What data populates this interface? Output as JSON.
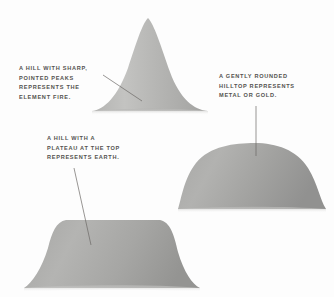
{
  "figure": {
    "background_color": "#fdfdfd",
    "text_color": "#54524f",
    "leader_line_color": "#6b6965",
    "hill_fill_light": "#bfbfbd",
    "hill_fill_mid": "#a8a8a6",
    "hill_fill_dark": "#949492"
  },
  "annotations": [
    {
      "id": "fire",
      "name": "fire-hill-caption",
      "lines": [
        "A HILL WITH SHARP,",
        "POINTED PEAKS",
        "REPRESENTS THE",
        "ELEMENT FIRE."
      ]
    },
    {
      "id": "metal",
      "name": "metal-hill-caption",
      "lines": [
        "A GENTLY ROUNDED",
        "HILLTOP REPRESENTS",
        "METAL OR GOLD."
      ]
    },
    {
      "id": "earth",
      "name": "earth-hill-caption",
      "lines": [
        "A HILL WITH A",
        "PLATEAU AT THE TOP",
        "REPRESENTS EARTH."
      ]
    }
  ],
  "hills": [
    {
      "id": "fire",
      "name": "fire-hill-shape",
      "element": "FIRE",
      "profile": "sharp pointed peak",
      "base_x": [
        92,
        208
      ],
      "peak_x": 148,
      "peak_y": 18,
      "base_y": 111
    },
    {
      "id": "metal",
      "name": "metal-hill-shape",
      "element": "METAL OR GOLD",
      "profile": "gently rounded dome",
      "base_x": [
        178,
        326
      ],
      "peak_x": 255,
      "peak_y": 143,
      "base_y": 209
    },
    {
      "id": "earth",
      "name": "earth-hill-shape",
      "element": "EARTH",
      "profile": "flat plateau top",
      "base_x": [
        24,
        200
      ],
      "plateau_x": [
        58,
        166
      ],
      "plateau_y": 220,
      "base_y": 288
    }
  ]
}
